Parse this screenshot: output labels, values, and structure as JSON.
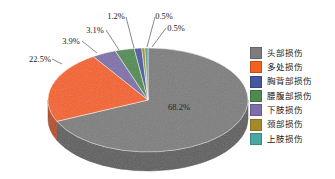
{
  "chart_data": {
    "type": "pie",
    "title": "",
    "subtitle": "",
    "xlabel": "",
    "ylabel": "",
    "grid": false,
    "legend_position": "right",
    "three_d": true,
    "start_angle_deg": 0,
    "direction": "clockwise",
    "categories": [
      "头部损伤",
      "多处损伤",
      "胸背部损伤",
      "腰腹部损伤",
      "下肢损伤",
      "颈部损伤",
      "上肢损伤"
    ],
    "values": [
      68.2,
      22.5,
      1.2,
      3.1,
      3.9,
      0.5,
      0.5
    ],
    "value_unit": "%",
    "data_labels": [
      "68.2%",
      "22.5%",
      "1.2%",
      "3.1%",
      "3.9%",
      "0.5%",
      "0.5%"
    ],
    "colors": [
      "#7d7d7d",
      "#f4601e",
      "#46589e",
      "#4e8b4e",
      "#7e6fa8",
      "#a8892a",
      "#4aa8a0"
    ],
    "slices": [
      {
        "label": "头部损伤",
        "value": 68.2,
        "display": "68.2%",
        "color": "#7d7d7d",
        "label_placement": "inside"
      },
      {
        "label": "多处损伤",
        "value": 22.5,
        "display": "22.5%",
        "color": "#f4601e",
        "label_placement": "outside"
      },
      {
        "label": "下肢损伤",
        "value": 3.9,
        "display": "3.9%",
        "color": "#7e6fa8",
        "label_placement": "outside"
      },
      {
        "label": "腰腹部损伤",
        "value": 3.1,
        "display": "3.1%",
        "color": "#4e8b4e",
        "label_placement": "outside"
      },
      {
        "label": "胸背部损伤",
        "value": 1.2,
        "display": "1.2%",
        "color": "#46589e",
        "label_placement": "outside"
      },
      {
        "label": "颈部损伤",
        "value": 0.5,
        "display": "0.5%",
        "color": "#a8892a",
        "label_placement": "outside"
      },
      {
        "label": "上肢损伤",
        "value": 0.5,
        "display": "0.5%",
        "color": "#4aa8a0",
        "label_placement": "outside"
      }
    ]
  },
  "labels": {
    "head": "68.2%",
    "multiple": "22.5%",
    "lower_limb": "3.9%",
    "abdomen": "3.1%",
    "chest_back": "1.2%",
    "neck": "0.5%",
    "upper_limb": "0.5%"
  },
  "legend": {
    "items": [
      {
        "label": "头部损伤",
        "color": "#7d7d7d"
      },
      {
        "label": "多处损伤",
        "color": "#f4601e"
      },
      {
        "label": "胸背部损伤",
        "color": "#46589e"
      },
      {
        "label": "腰腹部损伤",
        "color": "#4e8b4e"
      },
      {
        "label": "下肢损伤",
        "color": "#7e6fa8"
      },
      {
        "label": "颈部损伤",
        "color": "#a8892a"
      },
      {
        "label": "上肢损伤",
        "color": "#4aa8a0"
      }
    ]
  }
}
